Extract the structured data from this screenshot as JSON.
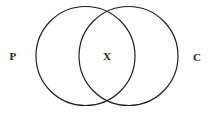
{
  "figure": {
    "type": "venn-diagram",
    "background_color": "#ffffff",
    "stroke_color": "#1a1a1a",
    "text_color": "#262626",
    "width": 214,
    "height": 113
  },
  "sets": {
    "left": {
      "label": "P",
      "label_x": 13,
      "label_y": 56,
      "center_x": 85.5,
      "center_y": 56,
      "radius": 49.5
    },
    "right": {
      "label": "C",
      "label_x": 197,
      "label_y": 57,
      "center_x": 128.5,
      "center_y": 56,
      "radius": 49.5
    }
  },
  "intersection": {
    "label": "X",
    "label_x": 107,
    "label_y": 56
  }
}
